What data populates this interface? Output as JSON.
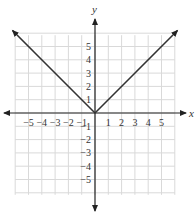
{
  "chart_data": {
    "type": "line",
    "title": "",
    "function": "y = |x|",
    "xlabel": "x",
    "ylabel": "y",
    "xlim": [
      -6,
      6
    ],
    "ylim": [
      -6,
      6
    ],
    "grid": true,
    "x_ticks": [
      -5,
      -4,
      -3,
      -2,
      -1,
      1,
      2,
      3,
      4,
      5
    ],
    "y_ticks": [
      5,
      4,
      3,
      2,
      1,
      -1,
      -2,
      -3,
      -4,
      -5
    ],
    "series": [
      {
        "name": "y = |x|",
        "x": [
          -6,
          -5,
          -4,
          -3,
          -2,
          -1,
          0,
          1,
          2,
          3,
          4,
          5,
          6
        ],
        "y": [
          6,
          5,
          4,
          3,
          2,
          1,
          0,
          1,
          2,
          3,
          4,
          5,
          6
        ]
      }
    ],
    "colors": {
      "line": "#333333",
      "grid": "#d9d9d9",
      "axis": "#222222"
    }
  }
}
